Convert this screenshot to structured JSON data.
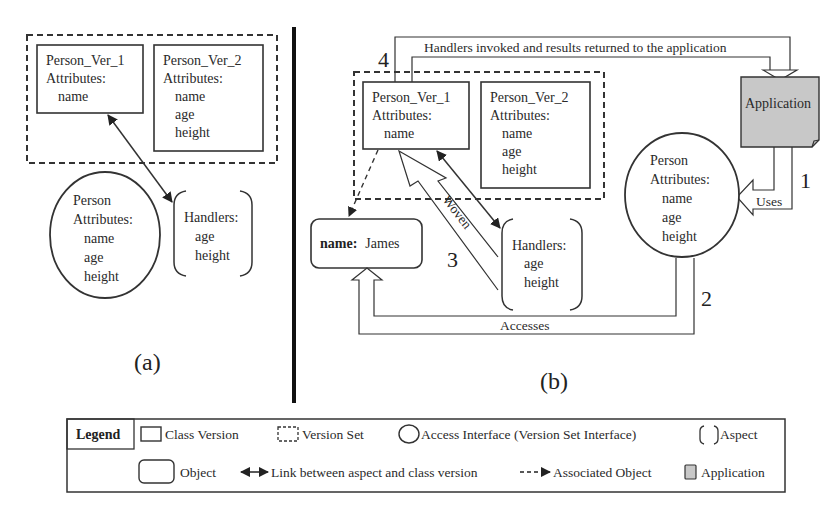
{
  "panel_a": {
    "caption": "(a)",
    "version_set": {
      "class_versions": [
        {
          "name": "Person_Ver_1",
          "attributes_label": "Attributes:",
          "attributes": [
            "name"
          ]
        },
        {
          "name": "Person_Ver_2",
          "attributes_label": "Attributes:",
          "attributes": [
            "name",
            "age",
            "height"
          ]
        }
      ]
    },
    "access_interface": {
      "name": "Person",
      "attributes_label": "Attributes:",
      "attributes": [
        "name",
        "age",
        "height"
      ]
    },
    "aspect": {
      "label": "Handlers:",
      "items": [
        "age",
        "height"
      ]
    }
  },
  "panel_b": {
    "caption": "(b)",
    "version_set": {
      "class_versions": [
        {
          "name": "Person_Ver_1",
          "attributes_label": "Attributes:",
          "attributes": [
            "name"
          ]
        },
        {
          "name": "Person_Ver_2",
          "attributes_label": "Attributes:",
          "attributes": [
            "name",
            "age",
            "height"
          ]
        }
      ]
    },
    "object": {
      "key": "name:",
      "value": "James"
    },
    "access_interface": {
      "name": "Person",
      "attributes_label": "Attributes:",
      "attributes": [
        "name",
        "age",
        "height"
      ]
    },
    "aspect": {
      "label": "Handlers:",
      "items": [
        "age",
        "height"
      ]
    },
    "application": {
      "label": "Application",
      "fill": "#c8c8c8"
    },
    "flows": {
      "uses": {
        "label": "Uses",
        "step": "1"
      },
      "accesses": {
        "label": "Accesses",
        "step": "2"
      },
      "woven": {
        "label": "Woven",
        "step": "3"
      },
      "handlers_invoked": {
        "label": "Handlers invoked and results returned to the application",
        "step": "4"
      }
    }
  },
  "legend": {
    "title": "Legend",
    "items": [
      {
        "icon": "class-version-icon",
        "label": "Class Version"
      },
      {
        "icon": "version-set-icon",
        "label": "Version Set"
      },
      {
        "icon": "access-interface-icon",
        "label": "Access Interface (Version Set Interface)"
      },
      {
        "icon": "aspect-icon",
        "label": "Aspect"
      },
      {
        "icon": "object-icon",
        "label": "Object"
      },
      {
        "icon": "link-arrow-icon",
        "label": "Link between aspect and class version"
      },
      {
        "icon": "associated-object-arrow-icon",
        "label": "Associated Object"
      },
      {
        "icon": "application-icon",
        "label": "Application"
      }
    ]
  }
}
